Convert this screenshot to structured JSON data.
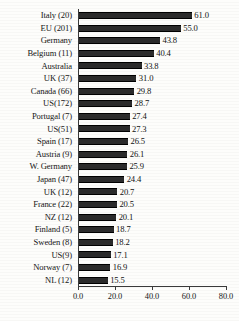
{
  "chart_data": {
    "type": "bar",
    "orientation": "horizontal",
    "title": "",
    "xlabel": "",
    "ylabel": "",
    "xlim": [
      0.0,
      80.0
    ],
    "grid": false,
    "legend": false,
    "axis_ticks": [
      "0.0",
      "20.0",
      "40.0",
      "60.0",
      "80.0"
    ],
    "axis_tick_values": [
      0.0,
      20.0,
      40.0,
      60.0,
      80.0
    ],
    "categories": [
      "Italy (20)",
      "EU (201)",
      "Germany",
      "Belgium (11)",
      "Australia",
      "UK (37)",
      "Canada (66)",
      "US(172)",
      "Portugal (7)",
      "US(51)",
      "Spain (17)",
      "Austria (9)",
      "W. Germany",
      "Japan (47)",
      "UK (12)",
      "France (22)",
      "NZ (12)",
      "Finland (5)",
      "Sweden (8)",
      "US(9)",
      "Norway (7)",
      "NL (12)"
    ],
    "values": [
      61.0,
      55.0,
      43.8,
      40.4,
      33.8,
      31.0,
      29.8,
      28.7,
      27.4,
      27.3,
      26.5,
      26.1,
      25.9,
      24.4,
      20.7,
      20.5,
      20.1,
      18.7,
      18.2,
      17.1,
      16.9,
      15.5
    ],
    "value_labels": [
      "61.0",
      "55.0",
      "43.8",
      "40.4",
      "33.8",
      "31.0",
      "29.8",
      "28.7",
      "27.4",
      "27.3",
      "26.5",
      "26.1",
      "25.9",
      "24.4",
      "20.7",
      "20.5",
      "20.1",
      "18.7",
      "18.2",
      "17.1",
      "16.9",
      "15.5"
    ],
    "bar_color": "#2b2b2b",
    "axis_color": "#3a3a3a",
    "background_color": "#fdfdfb"
  }
}
